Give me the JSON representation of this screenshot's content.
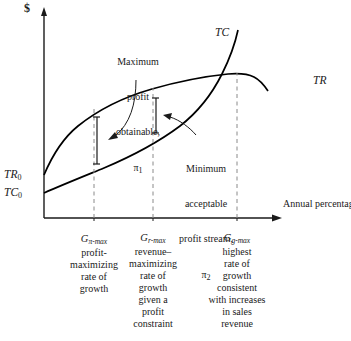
{
  "figure": {
    "type": "economics-diagram"
  },
  "axes": {
    "y_label": "$",
    "x_caption": "Annual percentage rate of growth in output",
    "y_intercepts": [
      {
        "name": "TR",
        "subscript": "0"
      },
      {
        "name": "TC",
        "subscript": "0"
      }
    ]
  },
  "curves": [
    {
      "key": "TC",
      "label": "TC",
      "description": "total cost curve, rising and convex, steeply increasing at high growth"
    },
    {
      "key": "TR",
      "label": "TR",
      "description": "total revenue curve, concave, peaks then declines slightly"
    }
  ],
  "annotations": [
    {
      "id": "pi1",
      "line1": "Maximum",
      "line2": "profit",
      "line3": "obtainable,",
      "symbol": "π",
      "symbol_sub": "1"
    },
    {
      "id": "pi2",
      "line1": "Minimum",
      "line2": "acceptable",
      "line3": "profit stream,",
      "symbol": "π",
      "symbol_sub": "2"
    }
  ],
  "x_ticks": [
    {
      "symbol": "G",
      "subscript": "π-max",
      "lines": [
        "profit-",
        "maximizing",
        "rate of",
        "growth"
      ]
    },
    {
      "symbol": "G",
      "subscript": "r-max",
      "lines": [
        "revenue–",
        "maximizing",
        "rate of",
        "growth",
        "given a",
        "profit",
        "constraint"
      ]
    },
    {
      "symbol": "G",
      "subscript": "g-max",
      "lines": [
        "highest",
        "rate of",
        "growth",
        "consistent",
        "with increases",
        "in sales",
        "revenue"
      ]
    }
  ],
  "colors": {
    "ink": "#1a1a1a",
    "curve": "#000000",
    "dashed": "#8a8a8a",
    "background": "#ffffff"
  }
}
